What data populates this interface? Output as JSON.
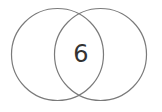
{
  "diagram": {
    "type": "venn",
    "sets": [
      {
        "name": "left-set",
        "cx": 57.5,
        "cy": 54.5,
        "r": 46
      },
      {
        "name": "right-set",
        "cx": 100.5,
        "cy": 54.5,
        "r": 46
      }
    ],
    "intersection_label": "6",
    "stroke_color": "#7a7a7a",
    "text_color": "#333333"
  }
}
